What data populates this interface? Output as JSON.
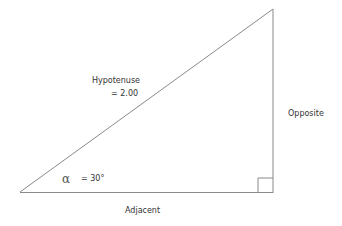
{
  "diagram": {
    "type": "right-triangle",
    "colors": {
      "line": "#8a8a8a",
      "text": "#333333",
      "background": "#ffffff"
    },
    "vertices": {
      "angle_vertex": [
        20,
        192
      ],
      "top_vertex": [
        273,
        9
      ],
      "right_angle_vertex": [
        273,
        193
      ]
    },
    "labels": {
      "hypotenuse": "Hypotenuse",
      "hypotenuse_value": "= 2.00",
      "opposite": "Opposite",
      "adjacent": "Adjacent",
      "angle_symbol": "α",
      "angle_value": "= 30°"
    },
    "right_angle_marker": {
      "size": 15
    }
  }
}
